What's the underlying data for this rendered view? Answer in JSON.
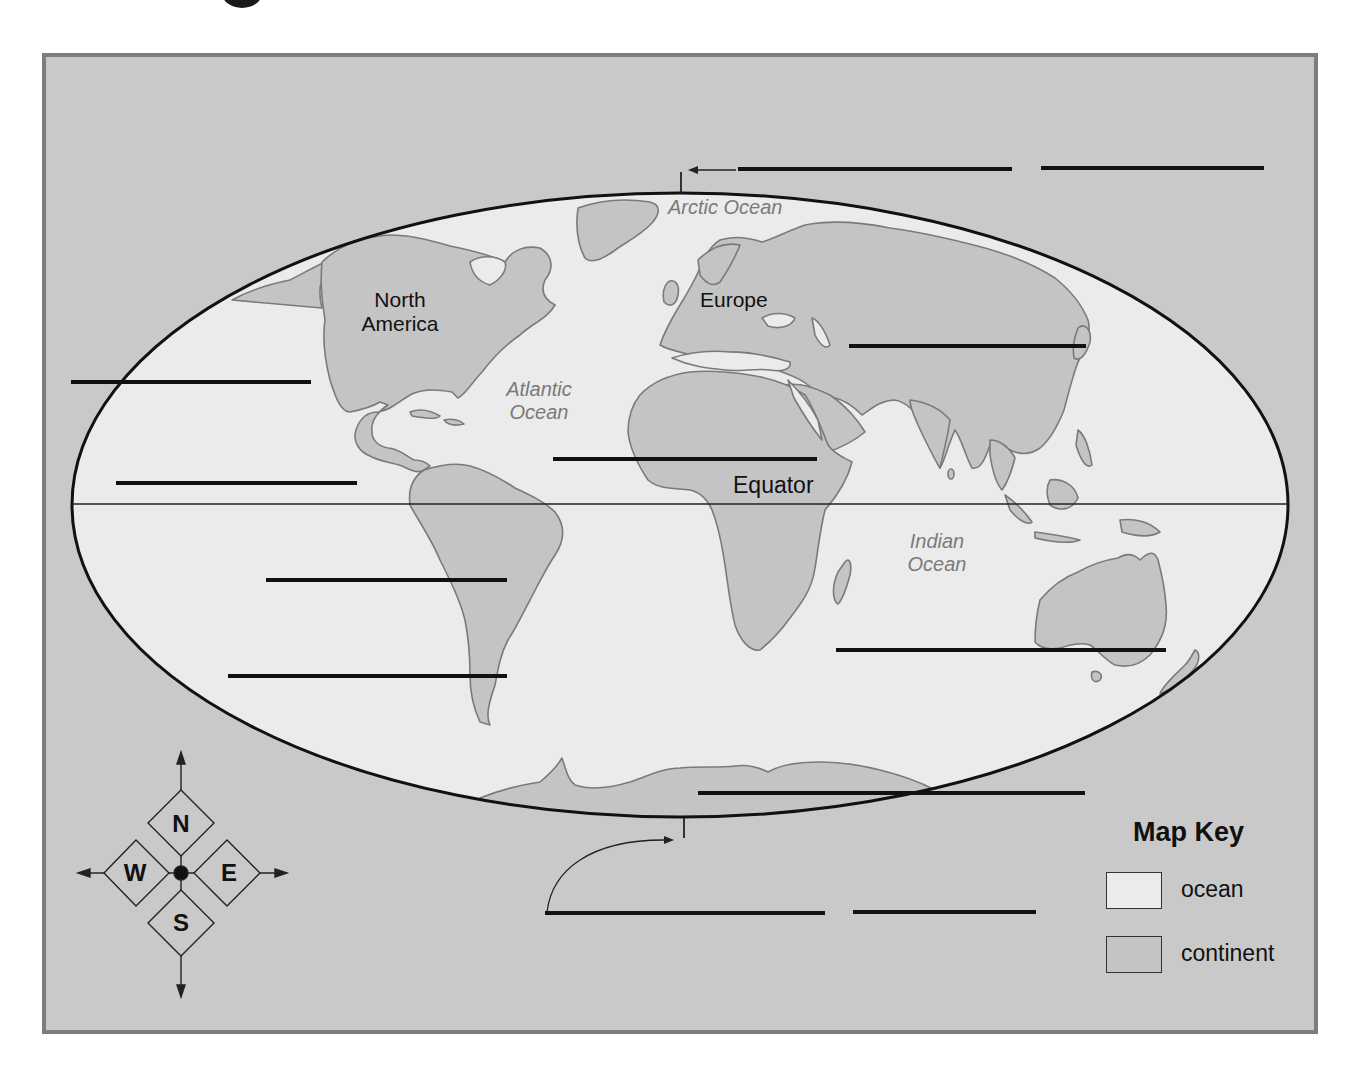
{
  "worksheet": {
    "colors": {
      "frame_background": "#c9c9c9",
      "frame_border": "#7d7d7d",
      "ocean": "#ebebeb",
      "continent": "#c4c4c4",
      "coastline": "#7a7a7a",
      "ink": "#111111",
      "ocean_label": "#7a7a7a"
    }
  },
  "map": {
    "projection": "elliptical world map",
    "equator": {
      "label": "Equator"
    },
    "continent_labels": [
      {
        "id": "north-america",
        "line1": "North",
        "line2": "America"
      },
      {
        "id": "europe",
        "line1": "Europe"
      }
    ],
    "ocean_labels": [
      {
        "id": "arctic",
        "line1": "Arctic Ocean"
      },
      {
        "id": "atlantic",
        "line1": "Atlantic",
        "line2": "Ocean"
      },
      {
        "id": "indian",
        "line1": "Indian",
        "line2": "Ocean"
      }
    ],
    "blank_answer_lines": [
      {
        "id": "north-pole-1",
        "x1": 738,
        "x2": 1012,
        "y": 169
      },
      {
        "id": "north-pole-2",
        "x1": 1041,
        "x2": 1264,
        "y": 168
      },
      {
        "id": "asia",
        "x1": 849,
        "x2": 1086,
        "y": 346
      },
      {
        "id": "pacific-north",
        "x1": 71,
        "x2": 311,
        "y": 382
      },
      {
        "id": "pacific-equator",
        "x1": 116,
        "x2": 357,
        "y": 483
      },
      {
        "id": "africa",
        "x1": 553,
        "x2": 817,
        "y": 459
      },
      {
        "id": "south-america",
        "x1": 266,
        "x2": 507,
        "y": 580
      },
      {
        "id": "pacific-south",
        "x1": 228,
        "x2": 507,
        "y": 676
      },
      {
        "id": "australia",
        "x1": 836,
        "x2": 1166,
        "y": 650
      },
      {
        "id": "antarctica",
        "x1": 698,
        "x2": 1085,
        "y": 793
      },
      {
        "id": "south-pole-1",
        "x1": 545,
        "x2": 825,
        "y": 913
      },
      {
        "id": "south-pole-2",
        "x1": 853,
        "x2": 1036,
        "y": 912
      }
    ]
  },
  "compass": {
    "north": "N",
    "south": "S",
    "east": "E",
    "west": "W"
  },
  "map_key": {
    "title": "Map Key",
    "items": [
      {
        "label": "ocean",
        "swatch": "#ebebeb"
      },
      {
        "label": "continent",
        "swatch": "#c4c4c4"
      }
    ]
  }
}
